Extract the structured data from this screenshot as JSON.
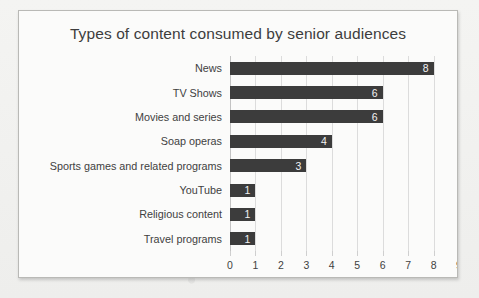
{
  "chart_data": {
    "type": "bar",
    "orientation": "horizontal",
    "title": "Types of content consumed by senior audiences",
    "xlabel": "",
    "ylabel": "",
    "xlim": [
      0,
      9
    ],
    "xticks": [
      "0",
      "1",
      "2",
      "3",
      "4",
      "5",
      "6",
      "7",
      "8",
      "9"
    ],
    "grid": true,
    "legend": false,
    "data_labels": true,
    "categories": [
      "News",
      "TV Shows",
      "Movies and series",
      "Soap operas",
      "Sports games and related programs",
      "YouTube",
      "Religious content",
      "Travel programs"
    ],
    "values": [
      8,
      6,
      6,
      4,
      3,
      1,
      1,
      1
    ],
    "bars": [
      {
        "label": "News",
        "value": 8,
        "value_label": "8"
      },
      {
        "label": "TV Shows",
        "value": 6,
        "value_label": "6"
      },
      {
        "label": "Movies and series",
        "value": 6,
        "value_label": "6"
      },
      {
        "label": "Soap operas",
        "value": 4,
        "value_label": "4"
      },
      {
        "label": "Sports games and related programs",
        "value": 3,
        "value_label": "3"
      },
      {
        "label": "YouTube",
        "value": 1,
        "value_label": "1"
      },
      {
        "label": "Religious content",
        "value": 1,
        "value_label": "1"
      },
      {
        "label": "Travel programs",
        "value": 1,
        "value_label": "1"
      }
    ],
    "colors": {
      "bar": "#3c3c3c",
      "data_label": "#f3f3f3",
      "grid": "#dcdcdc",
      "axis": "#c3c3c3",
      "text": "#3d3d3d",
      "plot_background": "#fbfbfa",
      "page_background": "#f2f2f0",
      "card_border": "#b9b9b6"
    }
  }
}
